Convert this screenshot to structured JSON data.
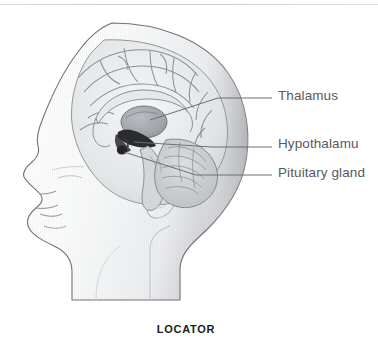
{
  "figure": {
    "caption": "LOCATOR"
  },
  "labels": [
    {
      "id": "thalamus",
      "text": "Thalamus",
      "clipped": false
    },
    {
      "id": "hypothalamus",
      "text": "Hypothalamu",
      "clipped": true
    },
    {
      "id": "pituitary",
      "text": "Pituitary gland",
      "clipped": true
    }
  ],
  "colors": {
    "text": "#58595b",
    "caption": "#1b1b1b",
    "leader_line": "#6d6e70",
    "outline": "#6f7173",
    "skin_light": "#fbfbfc",
    "skin_shade": "#dcdee0",
    "brain_light": "#eceef0",
    "brain_mid": "#c6c9cc",
    "brain_dark": "#9a9da1",
    "structure_dark": "#2b2c2e",
    "background": "#ffffff"
  },
  "leaders": [
    {
      "id": "thalamus-leader",
      "y": 98
    },
    {
      "id": "hypothalamus-leader",
      "y": 147
    },
    {
      "id": "pituitary-leader",
      "y": 175
    }
  ],
  "structures": [
    {
      "id": "thalamus",
      "name": "thalamus"
    },
    {
      "id": "hypothalamus",
      "name": "hypothalamus"
    },
    {
      "id": "pituitary-gland",
      "name": "pituitary-gland"
    },
    {
      "id": "cerebrum",
      "name": "cerebrum"
    },
    {
      "id": "cerebellum",
      "name": "cerebellum"
    },
    {
      "id": "brainstem",
      "name": "brainstem"
    },
    {
      "id": "corpus-callosum",
      "name": "corpus-callosum"
    }
  ]
}
